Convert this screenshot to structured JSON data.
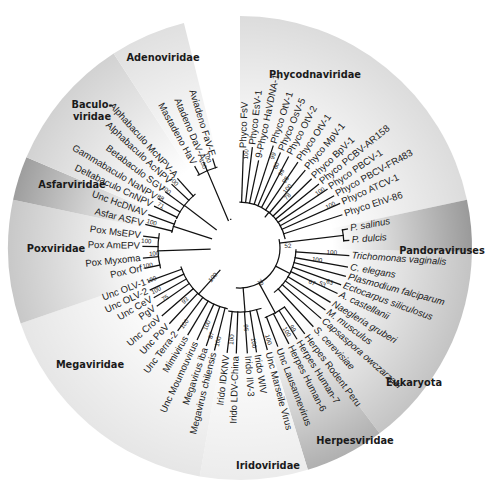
{
  "diagram": {
    "type": "circular-phylogenetic-tree",
    "center": [
      240,
      248
    ],
    "outer_radius": 232,
    "sectors": [
      {
        "name": "Phycodnaviridae",
        "from": 0,
        "to": 78,
        "fill": "#dcdcdc",
        "label_pos": [
          315,
          78
        ],
        "label_angle": 0
      },
      {
        "name": "Pandoraviruses",
        "from": 78,
        "to": 91,
        "fill": "#9a9a9a",
        "label_pos": [
          442,
          254
        ],
        "label_angle": 0
      },
      {
        "name": "Eukaryota",
        "from": 91,
        "to": 143,
        "fill": "#c4c4c4",
        "label_pos": [
          414,
          386
        ],
        "label_angle": 0
      },
      {
        "name": "Herpesviridae",
        "from": 143,
        "to": 163,
        "fill": "#b0b0b0",
        "label_pos": [
          355,
          444
        ],
        "label_angle": 0
      },
      {
        "name": "Iridoviridae",
        "from": 163,
        "to": 190,
        "fill": "#ececec",
        "label_pos": [
          268,
          469
        ],
        "label_angle": 0
      },
      {
        "name": "Megaviridae",
        "from": 190,
        "to": 251,
        "fill": "#e6e6e6",
        "label_pos": [
          90,
          368
        ],
        "label_angle": 0
      },
      {
        "name": "Poxviridae",
        "from": 251,
        "to": 282,
        "fill": "#c8c8c8",
        "label_pos": [
          56,
          252
        ],
        "label_angle": 0
      },
      {
        "name": "Asfarviridae",
        "from": 282,
        "to": 293,
        "fill": "#9e9e9e",
        "label_pos": [
          72,
          188
        ],
        "label_angle": 0
      },
      {
        "name": "Baculo-\nviridae",
        "from": 293,
        "to": 327,
        "fill": "#d2d2d2",
        "label_pos": [
          92,
          108
        ],
        "label_angle": 0
      },
      {
        "name": "Adenoviridae",
        "from": 327,
        "to": 346,
        "fill": "#e0e0e0",
        "label_pos": [
          163,
          61
        ],
        "label_angle": 0
      }
    ],
    "leaves": [
      {
        "label": "Phyco FsV",
        "angle": 2,
        "r": 100,
        "italic": false
      },
      {
        "label": "Phyco EsV-1",
        "angle": 7,
        "r": 104,
        "italic": false
      },
      {
        "label": "9-Phyco HaVDNA-1",
        "angle": 12,
        "r": 92,
        "italic": false
      },
      {
        "label": "Phyco OtV-1",
        "angle": 18,
        "r": 110,
        "italic": false
      },
      {
        "label": "Phyco OsV-5",
        "angle": 23,
        "r": 106,
        "italic": false
      },
      {
        "label": "Phyco OtV-2",
        "angle": 28,
        "r": 106,
        "italic": false
      },
      {
        "label": "Phyco OtV-1",
        "angle": 34,
        "r": 106,
        "italic": false
      },
      {
        "label": "Phyco MpV-1",
        "angle": 40,
        "r": 104,
        "italic": false
      },
      {
        "label": "Phyco BpV-1",
        "angle": 46,
        "r": 102,
        "italic": false
      },
      {
        "label": "Phyco PCBV-AR158",
        "angle": 51,
        "r": 104,
        "italic": false
      },
      {
        "label": "Phyco PBCV-1",
        "angle": 56,
        "r": 108,
        "italic": false
      },
      {
        "label": "Phyco PBCV-FR483",
        "angle": 61,
        "r": 110,
        "italic": false
      },
      {
        "label": "Phyco ATCV-1",
        "angle": 66,
        "r": 112,
        "italic": false
      },
      {
        "label": "Phyco EhV-86",
        "angle": 72,
        "r": 110,
        "italic": false
      },
      {
        "label": "P. salinus",
        "angle": 80,
        "r": 112,
        "italic": true
      },
      {
        "label": "P. dulcis",
        "angle": 86,
        "r": 112,
        "italic": true
      },
      {
        "label": "Trichomonas vaginalis",
        "angle": 94,
        "r": 112,
        "italic": true
      },
      {
        "label": "C. elegans",
        "angle": 100,
        "r": 112,
        "italic": true
      },
      {
        "label": "Plasmodium falciparum",
        "angle": 105,
        "r": 112,
        "italic": true
      },
      {
        "label": "Ectocarpus siliculosus",
        "angle": 110,
        "r": 110,
        "italic": true
      },
      {
        "label": "A. castellanii",
        "angle": 115,
        "r": 110,
        "italic": true
      },
      {
        "label": "Naegleria gruberi",
        "angle": 121,
        "r": 108,
        "italic": true
      },
      {
        "label": "M. musculus",
        "angle": 126,
        "r": 108,
        "italic": true
      },
      {
        "label": "Capsaspora owczarzaki",
        "angle": 131,
        "r": 110,
        "italic": true
      },
      {
        "label": "S. cerevisiae",
        "angle": 137,
        "r": 110,
        "italic": true
      },
      {
        "label": "Herpes Rodent Peru",
        "angle": 143,
        "r": 110,
        "italic": false
      },
      {
        "label": "Herpes Human-7",
        "angle": 148,
        "r": 110,
        "italic": false
      },
      {
        "label": "Herpes Human-6",
        "angle": 153,
        "r": 110,
        "italic": false
      },
      {
        "label": "Unc Lausannevirus",
        "angle": 159,
        "r": 108,
        "italic": false
      },
      {
        "label": "Unc Marseile Virus",
        "angle": 165,
        "r": 108,
        "italic": false
      },
      {
        "label": "Irido WIV",
        "angle": 171,
        "r": 108,
        "italic": false
      },
      {
        "label": "Irido IIV-3",
        "angle": 176,
        "r": 108,
        "italic": false
      },
      {
        "label": "Irido LDV-China",
        "angle": 182,
        "r": 108,
        "italic": false
      },
      {
        "label": "Irido IDKNV",
        "angle": 187,
        "r": 108,
        "italic": false
      },
      {
        "label": "Megavirus chilensis",
        "angle": 194,
        "r": 108,
        "italic": false
      },
      {
        "label": "Megavirus iba",
        "angle": 199,
        "r": 106,
        "italic": false
      },
      {
        "label": "Unc Moumouvirus",
        "angle": 205,
        "r": 104,
        "italic": false
      },
      {
        "label": "Mimivirus",
        "angle": 211,
        "r": 104,
        "italic": false
      },
      {
        "label": "Unc Terra-2",
        "angle": 217,
        "r": 106,
        "italic": false
      },
      {
        "label": "Unc PoV",
        "angle": 223,
        "r": 106,
        "italic": false
      },
      {
        "label": "Unc CroV",
        "angle": 229,
        "r": 106,
        "italic": false
      },
      {
        "label": "PgV",
        "angle": 235,
        "r": 104,
        "italic": false
      },
      {
        "label": "Unc CeV",
        "angle": 240,
        "r": 102,
        "italic": false
      },
      {
        "label": "Unc OLV-2",
        "angle": 245,
        "r": 102,
        "italic": false
      },
      {
        "label": "Unc OLV-1",
        "angle": 250,
        "r": 100,
        "italic": false
      },
      {
        "label": "Pox Orf",
        "angle": 258,
        "r": 100,
        "italic": false
      },
      {
        "label": "Pox Myxoma",
        "angle": 264,
        "r": 100,
        "italic": false
      },
      {
        "label": "Pox AmEPV",
        "angle": 271,
        "r": 100,
        "italic": false
      },
      {
        "label": "Pox MsEPV",
        "angle": 277,
        "r": 100,
        "italic": false
      },
      {
        "label": "Asfar ASFV",
        "angle": 284,
        "r": 100,
        "italic": false
      },
      {
        "label": "Unc HcDNAV",
        "angle": 290,
        "r": 100,
        "italic": false
      },
      {
        "label": "Deltabaculo CnNPV",
        "angle": 296,
        "r": 98,
        "italic": false
      },
      {
        "label": "Gammabaculo NaNPV",
        "angle": 301,
        "r": 98,
        "italic": false
      },
      {
        "label": "Betabaculo SGV",
        "angle": 307,
        "r": 96,
        "italic": false
      },
      {
        "label": "Alphabaculo AcNPV",
        "angle": 313,
        "r": 96,
        "italic": false
      },
      {
        "label": "Alphabaculo McNPV-A",
        "angle": 318,
        "r": 96,
        "italic": false
      },
      {
        "label": "Mastadeno HaV",
        "angle": 331,
        "r": 96,
        "italic": false
      },
      {
        "label": "Atadeno DaV-A",
        "angle": 337,
        "r": 96,
        "italic": false
      },
      {
        "label": "Aviadeno FaV-E",
        "angle": 343,
        "r": 96,
        "italic": false
      }
    ],
    "support_values": [
      {
        "value": "100",
        "angle": 4,
        "r": 94
      },
      {
        "value": "99",
        "angle": 20,
        "r": 98
      },
      {
        "value": "60",
        "angle": 24,
        "r": 90
      },
      {
        "value": "99",
        "angle": 29,
        "r": 86
      },
      {
        "value": "98",
        "angle": 34,
        "r": 82
      },
      {
        "value": "100",
        "angle": 39,
        "r": 76
      },
      {
        "value": "78",
        "angle": 43,
        "r": 70
      },
      {
        "value": "100",
        "angle": 55,
        "r": 98
      },
      {
        "value": "100",
        "angle": 65,
        "r": 100
      },
      {
        "value": "52",
        "angle": 88,
        "r": 48
      },
      {
        "value": "100",
        "angle": 93,
        "r": 92
      },
      {
        "value": "100",
        "angle": 99,
        "r": 78
      },
      {
        "value": "63",
        "angle": 111,
        "r": 96
      },
      {
        "value": "53",
        "angle": 114,
        "r": 90
      },
      {
        "value": "67",
        "angle": 116,
        "r": 80
      },
      {
        "value": "79",
        "angle": 150,
        "r": 40
      },
      {
        "value": "99",
        "angle": 147,
        "r": 96
      },
      {
        "value": "100",
        "angle": 151,
        "r": 96
      },
      {
        "value": "100",
        "angle": 163,
        "r": 96
      },
      {
        "value": "95",
        "angle": 176,
        "r": 80
      },
      {
        "value": "100",
        "angle": 172,
        "r": 96
      },
      {
        "value": "100",
        "angle": 185,
        "r": 92
      },
      {
        "value": "100",
        "angle": 193,
        "r": 96
      },
      {
        "value": "87",
        "angle": 198,
        "r": 92
      },
      {
        "value": "100",
        "angle": 203,
        "r": 84
      },
      {
        "value": "100",
        "angle": 216,
        "r": 94
      },
      {
        "value": "93",
        "angle": 226,
        "r": 76
      },
      {
        "value": "75",
        "angle": 236,
        "r": 90
      },
      {
        "value": "100",
        "angle": 243,
        "r": 94
      },
      {
        "value": "100",
        "angle": 250,
        "r": 94
      },
      {
        "value": "100",
        "angle": 222,
        "r": 40
      },
      {
        "value": "100",
        "angle": 259,
        "r": 94
      },
      {
        "value": "100",
        "angle": 266,
        "r": 86
      },
      {
        "value": "100",
        "angle": 274,
        "r": 94
      },
      {
        "value": "100",
        "angle": 286,
        "r": 92
      },
      {
        "value": "71",
        "angle": 298,
        "r": 90
      },
      {
        "value": "88",
        "angle": 302,
        "r": 94
      },
      {
        "value": "100",
        "angle": 308,
        "r": 94
      },
      {
        "value": "100",
        "angle": 315,
        "r": 94
      },
      {
        "value": "100",
        "angle": 336,
        "r": 92
      },
      {
        "value": "100",
        "angle": 340,
        "r": 96
      }
    ]
  }
}
